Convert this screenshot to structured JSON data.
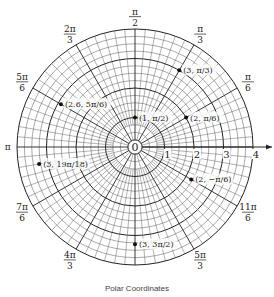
{
  "title": "Polar Coordinates",
  "radial_labels": [
    "1",
    "2",
    "3",
    "4"
  ],
  "origin_label": "0",
  "angle_labels": [
    {
      "angle_deg": 90,
      "num": "π",
      "den": "2"
    },
    {
      "angle_deg": 60,
      "num": "π",
      "den": "3"
    },
    {
      "angle_deg": 30,
      "num": "π",
      "den": "6"
    },
    {
      "angle_deg": 120,
      "num": "2π",
      "den": "3"
    },
    {
      "angle_deg": 150,
      "num": "5π",
      "den": "6"
    },
    {
      "angle_deg": 180,
      "num": "π",
      "den": ""
    },
    {
      "angle_deg": 210,
      "num": "7π",
      "den": "6"
    },
    {
      "angle_deg": 240,
      "num": "4π",
      "den": "3"
    },
    {
      "angle_deg": 300,
      "num": "5π",
      "den": "3"
    },
    {
      "angle_deg": 330,
      "num": "11π",
      "den": "6"
    }
  ],
  "points": [
    {
      "r": 3,
      "theta_deg": 60,
      "label": "(3, π/3)"
    },
    {
      "r": 2.9,
      "theta_deg": 150,
      "label": "(2.6, 5π/6)"
    },
    {
      "r": 1,
      "theta_deg": 90,
      "label": "(1, π/2)"
    },
    {
      "r": 2,
      "theta_deg": 30,
      "label": "(2, π/6)"
    },
    {
      "r": 3.3,
      "theta_deg": 190,
      "label": "(3, 19π/18)"
    },
    {
      "r": 2.2,
      "theta_deg": 330,
      "label": "(2, −π/6)"
    },
    {
      "r": 3.3,
      "theta_deg": 270,
      "label": "(3, 3π/2)"
    }
  ],
  "grid": {
    "r_max": 4,
    "r_major_step": 1,
    "r_minor_step": 0.25,
    "theta_major_deg": 30,
    "theta_minor_deg": 5
  }
}
